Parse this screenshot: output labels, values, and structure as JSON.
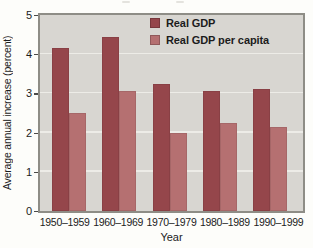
{
  "colors": {
    "bar_real_gdp": "#95464b",
    "bar_real_gdp_per_capita": "#b57071",
    "plot_bg": "#d8d6d1",
    "grid": "#edece7",
    "frame": "#8e8d86",
    "text": "#1c1c1c",
    "page_bg": "#fdfdfa"
  },
  "chart_data": {
    "type": "bar",
    "categories": [
      "1950–1959",
      "1960–1969",
      "1970–1979",
      "1980–1989",
      "1990–1999"
    ],
    "series": [
      {
        "name": "Real GDP",
        "color": "#95464b",
        "values": [
          4.15,
          4.45,
          3.25,
          3.05,
          3.1
        ]
      },
      {
        "name": "Real GDP per capita",
        "color": "#b57071",
        "values": [
          2.5,
          3.05,
          2.0,
          2.25,
          2.15
        ]
      }
    ],
    "xlabel": "Year",
    "ylabel": "Average annual increase (percent)",
    "ylim": [
      0,
      5
    ],
    "yticks": [
      0,
      1,
      2,
      3,
      4,
      5
    ],
    "grid": true,
    "legend_position": "inside-top-center"
  }
}
